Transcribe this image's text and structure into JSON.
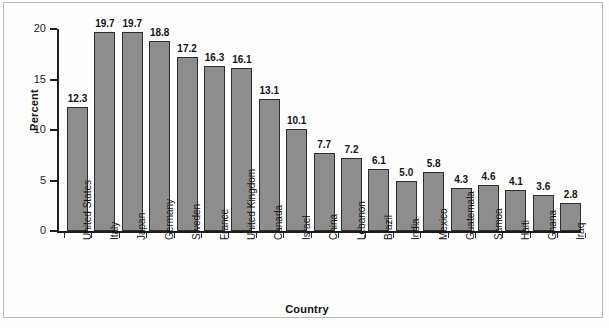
{
  "chart_data": {
    "type": "bar",
    "title": "",
    "xlabel": "Country",
    "ylabel": "Percent",
    "ylim": [
      0,
      20
    ],
    "yticks": [
      0,
      5,
      10,
      15,
      20
    ],
    "ytick_labels": [
      "0",
      "5",
      "10",
      "15",
      "20"
    ],
    "grid": false,
    "legend": "none",
    "bar_color": "#8d8d8d",
    "bar_edge_color": "#2e2e2e",
    "value_labels_shown": true,
    "categories": [
      "United States",
      "Italy",
      "Japan",
      "Germany",
      "Sweden",
      "France",
      "United Kingdom",
      "Canada",
      "Israel",
      "China",
      "Lebanon",
      "Brazil",
      "India",
      "Mexico",
      "Guatemala",
      "Samoa",
      "Haiti",
      "Ghana",
      "Iraq"
    ],
    "values": [
      12.3,
      19.7,
      19.7,
      18.8,
      17.2,
      16.3,
      16.1,
      13.1,
      10.1,
      7.7,
      7.2,
      6.1,
      5.0,
      5.8,
      4.3,
      4.6,
      4.1,
      3.6,
      2.8
    ],
    "value_labels": [
      "12.3",
      "19.7",
      "19.7",
      "18.8",
      "17.2",
      "16.3",
      "16.1",
      "13.1",
      "10.1",
      "7.7",
      "7.2",
      "6.1",
      "5.0",
      "5.8",
      "4.3",
      "4.6",
      "4.1",
      "3.6",
      "2.8"
    ]
  }
}
